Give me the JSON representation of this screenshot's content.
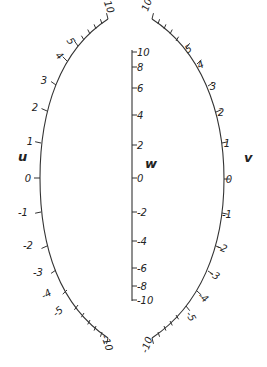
{
  "diagram": {
    "type": "nomogram",
    "colors": {
      "ink": "#333333",
      "background": "#ffffff"
    },
    "scales": {
      "u": {
        "name": "u",
        "name_pos": [
          18,
          161
        ],
        "side": "left",
        "ticks": [
          {
            "value": "10",
            "pos": [
              108,
              19
            ],
            "major": true,
            "label_pos": [
              106,
              8
            ],
            "rot": 70
          },
          {
            "value": "",
            "pos": [
              102,
              24
            ],
            "major": false
          },
          {
            "value": "",
            "pos": [
              96,
              29
            ],
            "major": false
          },
          {
            "value": "",
            "pos": [
              90,
              34
            ],
            "major": false
          },
          {
            "value": "",
            "pos": [
              84,
              40
            ],
            "major": false
          },
          {
            "value": "5",
            "pos": [
              78,
              46
            ],
            "major": true,
            "label_pos": [
              68,
              43
            ],
            "rot": 55
          },
          {
            "value": "4",
            "pos": [
              67,
              61
            ],
            "major": true,
            "label_pos": [
              57,
              58
            ],
            "rot": 45
          },
          {
            "value": "3",
            "pos": [
              56,
              85
            ],
            "major": true,
            "label_pos": [
              44,
              84
            ],
            "rot": 0
          },
          {
            "value": "2",
            "pos": [
              47,
              111
            ],
            "major": true,
            "label_pos": [
              35,
              111
            ],
            "rot": 0
          },
          {
            "value": "1",
            "pos": [
              41,
              143
            ],
            "major": true,
            "label_pos": [
              30,
              145
            ],
            "rot": 0
          },
          {
            "value": "0",
            "pos": [
              40,
              178
            ],
            "major": true,
            "label_pos": [
              28,
              182
            ],
            "rot": 0
          },
          {
            "value": "-1",
            "pos": [
              41,
              212
            ],
            "major": true,
            "label_pos": [
              23,
              216
            ],
            "rot": 0
          },
          {
            "value": "-2",
            "pos": [
              47,
              246
            ],
            "major": true,
            "label_pos": [
              28,
              249
            ],
            "rot": 0
          },
          {
            "value": "-3",
            "pos": [
              56,
              270
            ],
            "major": true,
            "label_pos": [
              38,
              276
            ],
            "rot": 0
          },
          {
            "value": "-4",
            "pos": [
              67,
              290
            ],
            "major": true,
            "label_pos": [
              48,
              297
            ],
            "rot": -30
          },
          {
            "value": "-5",
            "pos": [
              78,
              305
            ],
            "major": true,
            "label_pos": [
              60,
              314
            ],
            "rot": -40
          },
          {
            "value": "",
            "pos": [
              84,
              313
            ],
            "major": false
          },
          {
            "value": "",
            "pos": [
              90,
              320
            ],
            "major": false
          },
          {
            "value": "",
            "pos": [
              96,
              326
            ],
            "major": false
          },
          {
            "value": "",
            "pos": [
              102,
              332
            ],
            "major": false
          },
          {
            "value": "-10",
            "pos": [
              108,
              338
            ],
            "major": true,
            "label_pos": [
              104,
              344
            ],
            "rot": 70
          }
        ]
      },
      "w": {
        "name": "w",
        "name_pos": [
          145,
          168
        ],
        "line_x": 132,
        "line_y": [
          50,
          301
        ],
        "ticks": [
          {
            "value": "10",
            "y": 52
          },
          {
            "value": "8",
            "y": 67
          },
          {
            "value": "6",
            "y": 88
          },
          {
            "value": "4",
            "y": 115
          },
          {
            "value": "2",
            "y": 145
          },
          {
            "value": "0",
            "y": 178
          },
          {
            "value": "-2",
            "y": 212
          },
          {
            "value": "-4",
            "y": 241
          },
          {
            "value": "-6",
            "y": 268
          },
          {
            "value": "-8",
            "y": 286
          },
          {
            "value": "-10",
            "y": 300
          }
        ]
      },
      "v": {
        "name": "v",
        "name_pos": [
          244,
          162
        ],
        "side": "right",
        "ticks": [
          {
            "value": "10",
            "pos": [
              152,
              19
            ],
            "major": true,
            "label_pos": [
              150,
              6
            ],
            "rot": -70
          },
          {
            "value": "",
            "pos": [
              158,
              24
            ],
            "major": false
          },
          {
            "value": "",
            "pos": [
              164,
              29
            ],
            "major": false
          },
          {
            "value": "",
            "pos": [
              170,
              34
            ],
            "major": false
          },
          {
            "value": "",
            "pos": [
              176,
              41
            ],
            "major": false
          },
          {
            "value": "5",
            "pos": [
              186,
              48
            ],
            "major": true,
            "label_pos": [
              190,
              52
            ],
            "rot": -30
          },
          {
            "value": "4",
            "pos": [
              197,
              64
            ],
            "major": true,
            "label_pos": [
              202,
              68
            ],
            "rot": -25
          },
          {
            "value": "3",
            "pos": [
              208,
              86
            ],
            "major": true,
            "label_pos": [
              213,
              90
            ],
            "rot": 0
          },
          {
            "value": "2",
            "pos": [
              216,
              112
            ],
            "major": true,
            "label_pos": [
              221,
              116
            ],
            "rot": 0
          },
          {
            "value": "1",
            "pos": [
              222,
              143
            ],
            "major": true,
            "label_pos": [
              227,
              147
            ],
            "rot": 0
          },
          {
            "value": "0",
            "pos": [
              224,
              179
            ],
            "major": true,
            "label_pos": [
              229,
              183
            ],
            "rot": 0
          },
          {
            "value": "-1",
            "pos": [
              222,
              213
            ],
            "major": true,
            "label_pos": [
              227,
              218
            ],
            "rot": 0
          },
          {
            "value": "-2",
            "pos": [
              216,
              246
            ],
            "major": true,
            "label_pos": [
              221,
              251
            ],
            "rot": 20
          },
          {
            "value": "-3",
            "pos": [
              208,
              271
            ],
            "major": true,
            "label_pos": [
              213,
              278
            ],
            "rot": 30
          },
          {
            "value": "-4",
            "pos": [
              197,
              291
            ],
            "major": true,
            "label_pos": [
              201,
              300
            ],
            "rot": 40
          },
          {
            "value": "-5",
            "pos": [
              186,
              306
            ],
            "major": true,
            "label_pos": [
              188,
              318
            ],
            "rot": 60
          },
          {
            "value": "",
            "pos": [
              176,
              315
            ],
            "major": false
          },
          {
            "value": "",
            "pos": [
              170,
              321
            ],
            "major": false
          },
          {
            "value": "",
            "pos": [
              164,
              326
            ],
            "major": false
          },
          {
            "value": "",
            "pos": [
              158,
              332
            ],
            "major": false
          },
          {
            "value": "-10",
            "pos": [
              152,
              338
            ],
            "major": true,
            "label_pos": [
              150,
              346
            ],
            "rot": -70
          }
        ]
      }
    },
    "display_labels": {
      "u": [
        "10",
        "5",
        "4",
        "3",
        "2",
        "1",
        "0",
        "-1",
        "-2",
        "-3",
        "-4",
        "-5",
        "-10"
      ],
      "w": [
        "10",
        "8",
        "6",
        "4",
        "2",
        "0",
        "-2",
        "-4",
        "-6",
        "-8",
        "-10"
      ],
      "v": [
        "10",
        "5",
        "4",
        "3",
        "2",
        "1",
        "0",
        "-1",
        "-2",
        "-3",
        "-4",
        "-5",
        "-10"
      ]
    }
  }
}
